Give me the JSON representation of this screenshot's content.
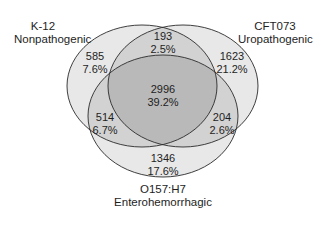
{
  "title": "",
  "sets": [
    {
      "id": "k12",
      "name": "K-12",
      "subtitle": "Nonpathogenic"
    },
    {
      "id": "cft073",
      "name": "CFT073",
      "subtitle": "Uropathogenic"
    },
    {
      "id": "o157",
      "name": "O157:H7",
      "subtitle": "Enterohemorrhagic"
    }
  ],
  "regions": {
    "k12_only": {
      "count": "585",
      "percent": "7.6%"
    },
    "k12_cft073": {
      "count": "193",
      "percent": "2.5%"
    },
    "cft073_only": {
      "count": "1623",
      "percent": "21.2%"
    },
    "all_three": {
      "count": "2996",
      "percent": "39.2%"
    },
    "k12_o157": {
      "count": "514",
      "percent": "6.7%"
    },
    "cft073_o157": {
      "count": "204",
      "percent": "2.6%"
    },
    "o157_only": {
      "count": "1346",
      "percent": "17.6%"
    }
  },
  "colors": {
    "single": "#e8e8e8",
    "double": "#d2d2d2",
    "triple": "#b9b9b9",
    "stroke": "#2a2a2a"
  }
}
